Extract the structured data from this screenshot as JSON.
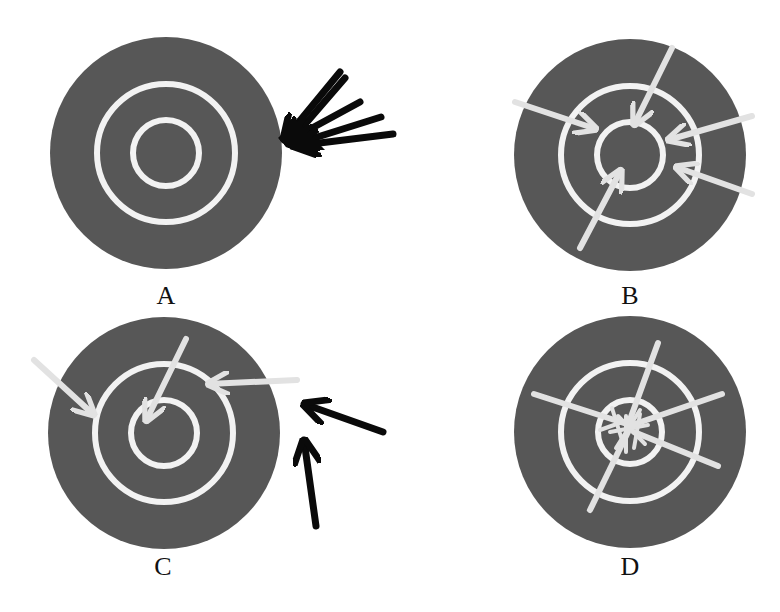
{
  "figure": {
    "colors": {
      "target_fill": "#575757",
      "ring": "#f2f2f2",
      "arrow_light": "#e2e2e2",
      "arrow_dark": "#0a0a0a",
      "background": "#ffffff"
    },
    "targets": [
      {
        "id": "A",
        "label": "A",
        "description": "All arrows black, clustered tightly together but off-target at right edge"
      },
      {
        "id": "B",
        "label": "B",
        "description": "Light arrows spread around the middle ring, not clustered"
      },
      {
        "id": "C",
        "label": "C",
        "description": "Light arrows scattered inside target; two black arrows missed outside"
      },
      {
        "id": "D",
        "label": "D",
        "description": "All light arrows tightly clustered in the bullseye"
      }
    ]
  }
}
